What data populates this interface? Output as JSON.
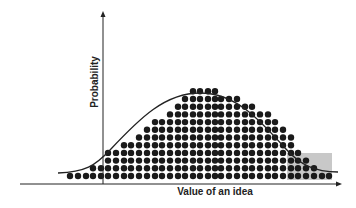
{
  "chart_data": {
    "type": "area",
    "title": "",
    "xlabel": "Value of an idea",
    "ylabel": "Probability",
    "grid": false,
    "legend": null,
    "curve": "normal distribution",
    "dot_columns": {
      "x_px": [
        70,
        78,
        86,
        93,
        101,
        108,
        116,
        124,
        131,
        139,
        147,
        155,
        162,
        170,
        178,
        185,
        193,
        200,
        208,
        215,
        221,
        229,
        237,
        245,
        252,
        260,
        268,
        275,
        283,
        291,
        298,
        306,
        314,
        322,
        329
      ],
      "rows": [
        1,
        1,
        1,
        2,
        2,
        4,
        4,
        5,
        5,
        6,
        7,
        8,
        8,
        9,
        10,
        11,
        12,
        12,
        12,
        12,
        11,
        11,
        11,
        10,
        10,
        9,
        9,
        8,
        7,
        6,
        4,
        3,
        2,
        1,
        1
      ]
    },
    "highlight_region": {
      "label": "right tail",
      "color": "#c8c8c8",
      "x_range_px": [
        287,
        332
      ],
      "y_range_px": [
        153,
        180
      ]
    }
  },
  "colors": {
    "axis": "#222222",
    "dot": "#1a1a1a",
    "curve": "#222222",
    "highlight": "#c8c8c8"
  }
}
